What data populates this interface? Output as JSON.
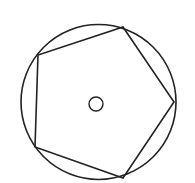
{
  "diagram": {
    "stroke_color": "#222222",
    "background": "#ffffff",
    "outer_circle": {
      "cx": 98.5,
      "cy": 102,
      "r": 77.5
    },
    "pentagon": {
      "vertices": [
        [
          123,
          27
        ],
        [
          174,
          102
        ],
        [
          123,
          178
        ],
        [
          35,
          147
        ],
        [
          38,
          55
        ]
      ]
    },
    "center_circle": {
      "cx": 96,
      "cy": 104,
      "r": 7
    }
  }
}
